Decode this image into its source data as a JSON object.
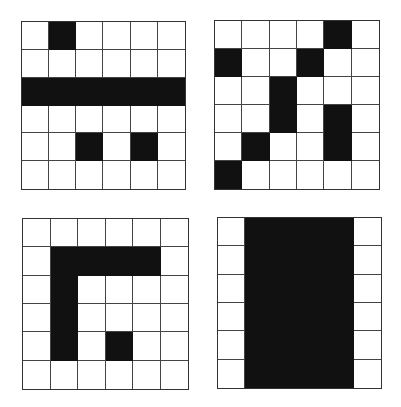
{
  "figure": {
    "colors": {
      "filled": "#111111",
      "empty": "#ffffff",
      "grid_line": "#444444"
    },
    "grids": [
      {
        "id": "top-left",
        "rect": [
          21,
          21,
          165,
          169
        ],
        "cells": [
          [
            0,
            1,
            0,
            0,
            0,
            0
          ],
          [
            0,
            0,
            0,
            0,
            0,
            0
          ],
          [
            1,
            1,
            1,
            1,
            1,
            1
          ],
          [
            0,
            0,
            0,
            0,
            0,
            0
          ],
          [
            0,
            0,
            1,
            0,
            1,
            0
          ],
          [
            0,
            0,
            0,
            0,
            0,
            0
          ]
        ]
      },
      {
        "id": "top-right",
        "rect": [
          214,
          20,
          166,
          170
        ],
        "cells": [
          [
            0,
            0,
            0,
            0,
            1,
            0
          ],
          [
            1,
            0,
            0,
            1,
            0,
            0
          ],
          [
            0,
            0,
            1,
            0,
            0,
            0
          ],
          [
            0,
            0,
            1,
            0,
            1,
            0
          ],
          [
            0,
            1,
            0,
            0,
            1,
            0
          ],
          [
            1,
            0,
            0,
            0,
            0,
            0
          ]
        ]
      },
      {
        "id": "bottom-left",
        "rect": [
          22,
          218,
          167,
          172
        ],
        "cells": [
          [
            0,
            0,
            0,
            0,
            0,
            0
          ],
          [
            0,
            1,
            1,
            1,
            1,
            0
          ],
          [
            0,
            1,
            0,
            0,
            0,
            0
          ],
          [
            0,
            1,
            0,
            0,
            0,
            0
          ],
          [
            0,
            1,
            0,
            1,
            0,
            0
          ],
          [
            0,
            0,
            0,
            0,
            0,
            0
          ]
        ]
      },
      {
        "id": "bottom-right",
        "rect": [
          217,
          217,
          165,
          172
        ],
        "cells": [
          [
            0,
            1,
            1,
            1,
            1,
            0
          ],
          [
            0,
            1,
            1,
            1,
            1,
            0
          ],
          [
            0,
            1,
            1,
            1,
            1,
            0
          ],
          [
            0,
            1,
            1,
            1,
            1,
            0
          ],
          [
            0,
            1,
            1,
            1,
            1,
            0
          ],
          [
            0,
            1,
            1,
            1,
            1,
            0
          ]
        ]
      }
    ]
  }
}
